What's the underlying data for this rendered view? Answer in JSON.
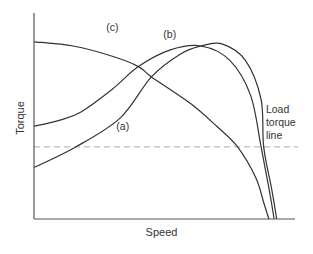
{
  "chart_data": {
    "type": "line",
    "title": "",
    "xlabel": "Speed",
    "ylabel": "Torque",
    "xlim": [
      0,
      1
    ],
    "ylim": [
      0,
      1
    ],
    "grid": false,
    "ticks": "none",
    "series": [
      {
        "name": "(c)",
        "color": "#333333",
        "points": [
          [
            0,
            0.86
          ],
          [
            0.15,
            0.84
          ],
          [
            0.3,
            0.79
          ],
          [
            0.4,
            0.74
          ],
          [
            0.45,
            0.69
          ],
          [
            0.6,
            0.56
          ],
          [
            0.7,
            0.45
          ],
          [
            0.78,
            0.35
          ],
          [
            0.85,
            0.2
          ],
          [
            0.88,
            0.08
          ],
          [
            0.9,
            0
          ]
        ]
      },
      {
        "name": "(b)",
        "color": "#333333",
        "points": [
          [
            0,
            0.45
          ],
          [
            0.1,
            0.48
          ],
          [
            0.18,
            0.52
          ],
          [
            0.3,
            0.63
          ],
          [
            0.4,
            0.74
          ],
          [
            0.52,
            0.82
          ],
          [
            0.64,
            0.84
          ],
          [
            0.75,
            0.77
          ],
          [
            0.83,
            0.6
          ],
          [
            0.87,
            0.35
          ],
          [
            0.9,
            0.15
          ],
          [
            0.92,
            0
          ]
        ]
      },
      {
        "name": "(a)",
        "color": "#333333",
        "points": [
          [
            0,
            0.25
          ],
          [
            0.16,
            0.35
          ],
          [
            0.33,
            0.49
          ],
          [
            0.45,
            0.69
          ],
          [
            0.56,
            0.8
          ],
          [
            0.64,
            0.84
          ],
          [
            0.72,
            0.85
          ],
          [
            0.81,
            0.77
          ],
          [
            0.87,
            0.58
          ],
          [
            0.88,
            0.35
          ],
          [
            0.91,
            0.15
          ],
          [
            0.93,
            0
          ]
        ]
      }
    ],
    "reference_lines": [
      {
        "name": "Load torque line",
        "orientation": "horizontal",
        "value": 0.35,
        "style": "dashed",
        "color": "#aaaaaa"
      }
    ],
    "annotations": [
      {
        "text": "(c)",
        "near_series": "(c)",
        "x": 0.3,
        "y": 0.93
      },
      {
        "text": "(b)",
        "near_series": "(b)",
        "x": 0.52,
        "y": 0.9
      },
      {
        "text": "(a)",
        "near_series": "(a)",
        "x": 0.34,
        "y": 0.45
      },
      {
        "text_lines": [
          "Load",
          "torque",
          "line"
        ],
        "near": "Load torque line",
        "x": 0.9,
        "y": 0.5
      }
    ]
  }
}
